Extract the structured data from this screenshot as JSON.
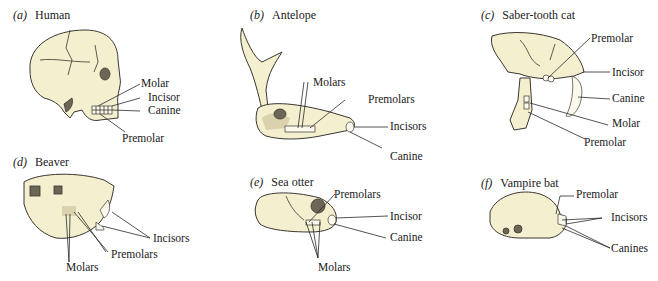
{
  "figure": {
    "panels": [
      {
        "id": "a",
        "letter": "(a)",
        "name": "Human",
        "labels": [
          "Molar",
          "Incisor",
          "Canine",
          "Premolar"
        ]
      },
      {
        "id": "b",
        "letter": "(b)",
        "name": "Antelope",
        "labels": [
          "Molars",
          "Premolars",
          "Incisors",
          "Canine"
        ]
      },
      {
        "id": "c",
        "letter": "(c)",
        "name": "Saber-tooth cat",
        "labels": [
          "Premolar",
          "Incisor",
          "Canine",
          "Molar",
          "Premolar"
        ]
      },
      {
        "id": "d",
        "letter": "(d)",
        "name": "Beaver",
        "labels": [
          "Incisors",
          "Premolars",
          "Molars"
        ]
      },
      {
        "id": "e",
        "letter": "(e)",
        "name": "Sea otter",
        "labels": [
          "Premolars",
          "Incisor",
          "Canine",
          "Molars"
        ]
      },
      {
        "id": "f",
        "letter": "(f)",
        "name": "Vampire bat",
        "labels": [
          "Premolar",
          "Incisors",
          "Canines"
        ]
      }
    ]
  },
  "colors": {
    "bone": "#f3efcf",
    "ink": "#3a3630",
    "background": "#ffffff"
  }
}
